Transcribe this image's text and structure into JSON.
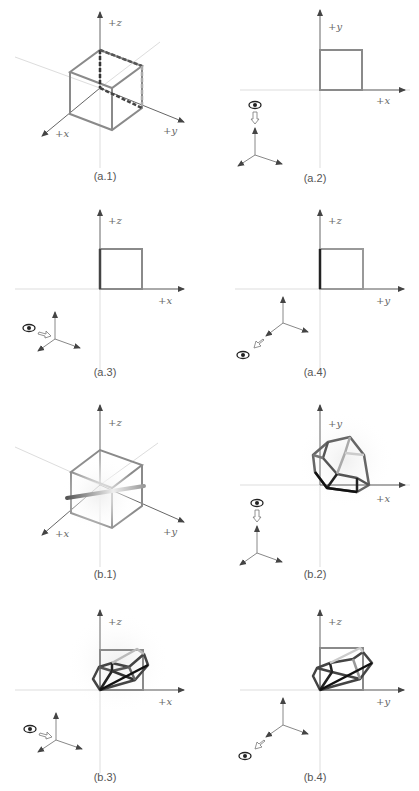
{
  "figure": {
    "panels": [
      {
        "id": "a1",
        "caption": "(a.1)",
        "view": "isometric",
        "axes": [
          "+z",
          "+x",
          "+y"
        ],
        "object": "cube",
        "eye_indicator": false
      },
      {
        "id": "a2",
        "caption": "(a.2)",
        "view": "top",
        "axes": [
          "+y",
          "+x"
        ],
        "object": "square",
        "eye_indicator": true,
        "eye_direction": "down"
      },
      {
        "id": "a3",
        "caption": "(a.3)",
        "view": "front",
        "axes": [
          "+z",
          "+x"
        ],
        "object": "square",
        "eye_indicator": true,
        "eye_direction": "right"
      },
      {
        "id": "a4",
        "caption": "(a.4)",
        "view": "side",
        "axes": [
          "+z",
          "+y"
        ],
        "object": "square",
        "eye_indicator": true,
        "eye_direction": "diagonal"
      },
      {
        "id": "b1",
        "caption": "(b.1)",
        "view": "isometric",
        "axes": [
          "+z",
          "+x",
          "+y"
        ],
        "object": "cube-with-rod",
        "eye_indicator": false
      },
      {
        "id": "b2",
        "caption": "(b.2)",
        "view": "top",
        "axes": [
          "+y",
          "+x"
        ],
        "object": "rotated-cube",
        "eye_indicator": true,
        "eye_direction": "down"
      },
      {
        "id": "b3",
        "caption": "(b.3)",
        "view": "front",
        "axes": [
          "+z",
          "+x"
        ],
        "object": "rotated-cube",
        "eye_indicator": true,
        "eye_direction": "right"
      },
      {
        "id": "b4",
        "caption": "(b.4)",
        "view": "side",
        "axes": [
          "+z",
          "+y"
        ],
        "object": "rotated-cube",
        "eye_indicator": true,
        "eye_direction": "diagonal"
      }
    ]
  },
  "labels": {
    "a1": {
      "caption": "(a.1)",
      "z": "+z",
      "x": "+x",
      "y": "+y"
    },
    "a2": {
      "caption": "(a.2)",
      "v": "+y",
      "h": "+x"
    },
    "a3": {
      "caption": "(a.3)",
      "v": "+z",
      "h": "+x"
    },
    "a4": {
      "caption": "(a.4)",
      "v": "+z",
      "h": "+y"
    },
    "b1": {
      "caption": "(b.1)",
      "z": "+z",
      "x": "+x",
      "y": "+y"
    },
    "b2": {
      "caption": "(b.2)",
      "v": "+y",
      "h": "+x"
    },
    "b3": {
      "caption": "(b.3)",
      "v": "+z",
      "h": "+x"
    },
    "b4": {
      "caption": "(b.4)",
      "v": "+z",
      "h": "+y"
    }
  },
  "colors": {
    "axis": "#777777",
    "guide": "#d8d8d8",
    "cube_edge": "#8a8a8a",
    "dark_edge": "#222222"
  }
}
